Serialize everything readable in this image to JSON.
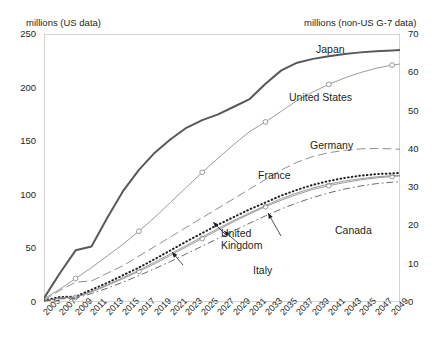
{
  "axis_titles": {
    "left": "millions (US data)",
    "right": "millions (non-US G-7 data)"
  },
  "series_labels": {
    "japan": "Japan",
    "united_states": "United States",
    "germany": "Germany",
    "france": "France",
    "canada": "Canada",
    "united_kingdom": "United\nKingdom",
    "italy": "Italy"
  },
  "chart_data": {
    "type": "line",
    "title": "",
    "xlabel": "",
    "ylabel": "millions (US data)",
    "y2label": "millions (non-US G-7 data)",
    "ylim": [
      0,
      250
    ],
    "y2lim": [
      0,
      70
    ],
    "yticks": [
      0,
      50,
      100,
      150,
      200,
      250
    ],
    "y2ticks": [
      0,
      10,
      20,
      30,
      40,
      50,
      60,
      70
    ],
    "xlim": [
      2005,
      2050
    ],
    "xticks": [
      2005,
      2007,
      2009,
      2011,
      2013,
      2015,
      2017,
      2019,
      2021,
      2023,
      2025,
      2027,
      2029,
      2031,
      2033,
      2035,
      2037,
      2039,
      2041,
      2043,
      2045,
      2047,
      2049
    ],
    "grid": false,
    "legend": "inline-annotations",
    "x": [
      2005,
      2007,
      2009,
      2011,
      2013,
      2015,
      2017,
      2019,
      2021,
      2023,
      2025,
      2027,
      2029,
      2031,
      2033,
      2035,
      2037,
      2039,
      2041,
      2043,
      2045,
      2047,
      2049,
      2050
    ],
    "series": [
      {
        "name": "Japan",
        "axis": "right",
        "style": "thick-solid",
        "values": [
          1.0,
          7.5,
          13.5,
          14.5,
          22.0,
          29.0,
          34.5,
          39.0,
          42.5,
          45.5,
          47.5,
          49.0,
          51.0,
          53.0,
          57.0,
          60.5,
          62.5,
          63.5,
          64.2,
          64.8,
          65.2,
          65.5,
          65.7,
          65.8
        ]
      },
      {
        "name": "United States",
        "axis": "left",
        "style": "thin-solid-circles",
        "values": [
          3,
          12,
          22,
          32,
          43,
          54,
          66,
          79,
          93,
          107,
          121,
          134,
          147,
          159,
          168,
          178,
          188,
          196,
          203,
          209,
          214,
          218,
          221,
          222
        ]
      },
      {
        "name": "Germany",
        "axis": "right",
        "style": "long-dash",
        "values": [
          0.5,
          3.0,
          5.2,
          5.5,
          7.5,
          9.5,
          12.0,
          14.5,
          17.0,
          19.5,
          22.0,
          24.5,
          27.0,
          29.5,
          32.0,
          34.5,
          36.5,
          38.0,
          39.0,
          39.6,
          40.0,
          40.1,
          40.0,
          39.9
        ]
      },
      {
        "name": "France",
        "axis": "right",
        "style": "dotted",
        "values": [
          0.4,
          1.3,
          1.4,
          3.2,
          5.0,
          7.0,
          9.0,
          11.2,
          13.5,
          15.8,
          18.0,
          20.2,
          22.2,
          24.2,
          26.0,
          27.8,
          29.3,
          30.6,
          31.6,
          32.4,
          33.0,
          33.4,
          33.6,
          33.7
        ]
      },
      {
        "name": "Canada",
        "axis": "right",
        "style": "thin-solid-circles",
        "values": [
          0.3,
          1.0,
          1.2,
          2.6,
          4.3,
          6.1,
          8.0,
          10.0,
          12.2,
          14.4,
          16.6,
          18.8,
          21.0,
          23.0,
          24.9,
          26.6,
          28.1,
          29.4,
          30.4,
          31.2,
          31.9,
          32.4,
          32.8,
          32.9
        ]
      },
      {
        "name": "United Kingdom",
        "axis": "right",
        "style": "thin-solid",
        "values": [
          0.3,
          1.1,
          1.3,
          2.8,
          4.5,
          6.4,
          8.3,
          10.4,
          12.6,
          14.8,
          17.0,
          19.2,
          21.3,
          23.3,
          25.2,
          27.0,
          28.5,
          29.8,
          30.8,
          31.6,
          32.2,
          32.7,
          33.0,
          33.1
        ]
      },
      {
        "name": "Italy",
        "axis": "right",
        "style": "dash-dot",
        "values": [
          0.2,
          0.8,
          1.0,
          2.2,
          3.6,
          5.2,
          6.9,
          8.7,
          10.6,
          12.6,
          14.6,
          16.6,
          18.6,
          20.6,
          22.5,
          24.3,
          25.9,
          27.3,
          28.5,
          29.5,
          30.3,
          30.9,
          31.3,
          31.4
        ]
      }
    ]
  }
}
